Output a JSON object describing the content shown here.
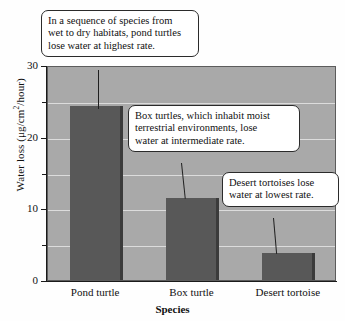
{
  "chart_data": {
    "type": "bar",
    "title": "",
    "xlabel": "Species",
    "ylabel": "Water loss (μg/cm²/hour)",
    "ylabel_prefix": "Water loss (μg/cm",
    "ylabel_sup": "2",
    "ylabel_suffix": "/hour)",
    "categories": [
      "Pond turtle",
      "Box turtle",
      "Desert tortoise"
    ],
    "values": [
      24.3,
      11.4,
      3.7
    ],
    "ylim": [
      0,
      30
    ],
    "yticks": [
      0,
      10,
      20,
      30
    ],
    "ytick_labels": [
      "0",
      "10",
      "20",
      "30"
    ],
    "yminor_ticks": [
      5,
      15,
      25
    ],
    "gridlines": [
      5,
      10,
      15,
      20,
      25
    ],
    "grid": true,
    "legend": "none",
    "bar_color": "#585858",
    "bar_edge_color": "#3b3b3b",
    "plot_background": "#a9a9a9",
    "gridline_color": "#dcdcdc",
    "axis_color": "#1a1a1a"
  },
  "annotations": [
    {
      "id": "pond-turtle-callout",
      "lines": [
        "In a sequence of species from",
        "wet to dry habitats, pond turtles",
        "lose water at highest rate."
      ]
    },
    {
      "id": "box-turtle-callout",
      "lines": [
        "Box turtles, which inhabit moist",
        "terrestrial environments, lose",
        "water at intermediate rate."
      ]
    },
    {
      "id": "desert-tortoise-callout",
      "lines": [
        "Desert tortoises lose",
        "water at lowest rate."
      ]
    }
  ]
}
